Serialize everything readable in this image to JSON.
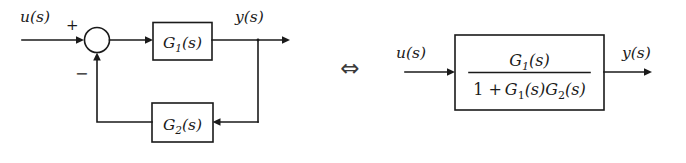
{
  "figure": {
    "type": "block-diagram",
    "background_color": "#ffffff",
    "line_color": "#1a1a1a"
  },
  "left_diagram": {
    "name": "closed-loop-feedback-system",
    "input_label": "u(s)",
    "output_label": "y(s)",
    "summing_junction": {
      "positive_sign": "+",
      "negative_sign": "−",
      "shape": "circle"
    },
    "forward_block_label": "G",
    "forward_block_sub": "1",
    "forward_block_arg": "(s)",
    "feedback_block_label": "G",
    "feedback_block_sub": "2",
    "feedback_block_arg": "(s)"
  },
  "equivalence": {
    "symbol": "⇔",
    "meaning": "is equivalent to"
  },
  "right_diagram": {
    "name": "equivalent-transfer-function",
    "input_label": "u(s)",
    "output_label": "y(s)",
    "transfer_function": {
      "numerator_label": "G",
      "numerator_sub": "1",
      "numerator_arg": "(s)",
      "denominator_one": "1 +",
      "denominator_first_label": "G",
      "denominator_first_sub": "1",
      "denominator_first_arg": "(s)",
      "denominator_second_label": "G",
      "denominator_second_sub": "2",
      "denominator_second_arg": "(s)",
      "full_text": "G1(s) / (1 + G1(s)G2(s))"
    }
  }
}
